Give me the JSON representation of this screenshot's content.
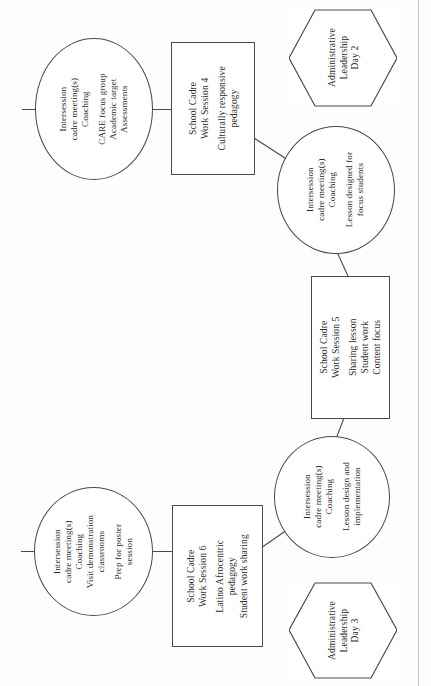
{
  "diagram": {
    "orientation": "rotated-90-ccw",
    "stroke_color": "#4a4a4a",
    "background_color": "#ffffff",
    "nodes": [
      {
        "id": "intersession-1",
        "shape": "ellipse",
        "lines": [
          "Intersession",
          "cadre  meeting(s)",
          "Coaching"
        ],
        "lines2": [
          "CARE focus group",
          "Academic target",
          "Assessments"
        ]
      },
      {
        "id": "work-session-4",
        "shape": "rectangle",
        "lines": [
          "School Cadre",
          "Work Session 4"
        ],
        "lines2": [
          "Culturally responsive",
          "pedagogy"
        ]
      },
      {
        "id": "admin-leadership-day-2",
        "shape": "hexagon",
        "lines": [
          "Administrative",
          "Leadership",
          "Day 2"
        ]
      },
      {
        "id": "intersession-2",
        "shape": "ellipse",
        "lines": [
          "Intersession",
          "cadre meeting(s)",
          "Coaching"
        ],
        "lines2": [
          "Lesson designed for",
          "focus students"
        ]
      },
      {
        "id": "work-session-5",
        "shape": "rectangle",
        "lines": [
          "School Cadre",
          "Work Session 5"
        ],
        "lines2": [
          "Sharing lesson",
          "Student work",
          "Content focus"
        ]
      },
      {
        "id": "intersession-3",
        "shape": "ellipse",
        "lines": [
          "Intersession",
          "cadre meeting(s)",
          "Coaching"
        ],
        "lines2": [
          "Lesson design and",
          "implementation"
        ]
      },
      {
        "id": "work-session-6",
        "shape": "rectangle",
        "lines": [
          "School Cadre",
          "Work Session 6"
        ],
        "lines2": [
          "Latino Afrocentric",
          "pedagogy",
          "Student work sharing"
        ]
      },
      {
        "id": "intersession-4",
        "shape": "ellipse",
        "lines": [
          "Intersession",
          "cadre meeting(s)",
          "Coaching",
          "Visit demonstration",
          "classrooms"
        ],
        "lines2": [
          "Prep for poster",
          "session"
        ]
      },
      {
        "id": "admin-leadership-day-3",
        "shape": "hexagon",
        "lines": [
          "Administrative",
          "Leadership",
          "Day 3"
        ]
      }
    ]
  }
}
